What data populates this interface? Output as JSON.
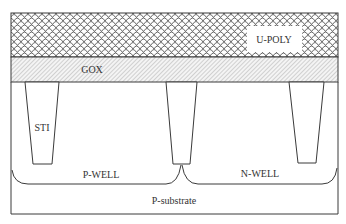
{
  "diagram": {
    "layers": {
      "poly": {
        "label": "U-POLY",
        "pattern": "scale-hatch"
      },
      "gox": {
        "label": "GOX",
        "pattern": "diagonal-hatch"
      },
      "sti": {
        "label": "STI",
        "count": 3
      },
      "pwell": {
        "label": "P-WELL"
      },
      "nwell": {
        "label": "N-WELL"
      },
      "substrate": {
        "label": "P-substrate"
      }
    },
    "colors": {
      "line": "#3a3a3a",
      "hatch": "#8a8a8a",
      "background": "#ffffff"
    }
  }
}
